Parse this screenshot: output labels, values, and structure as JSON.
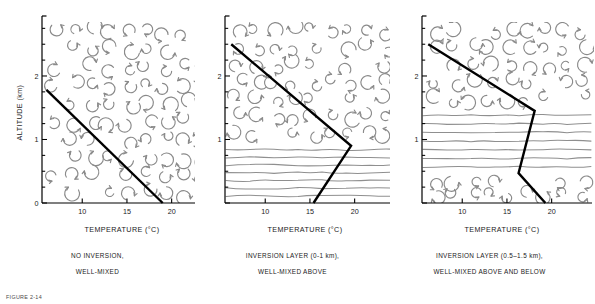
{
  "figure": {
    "caption_label": "FIGURE 2-14"
  },
  "axes": {
    "xlabel": "TEMPERATURE (°C)",
    "ylabel": "ALTITUDE (km)",
    "xticks": [
      10,
      15,
      20
    ],
    "xtick_labels": [
      "10",
      "15",
      "20"
    ],
    "yticks_major": [
      0,
      1,
      2
    ],
    "ytick_labels_panel1": [
      "0",
      "1",
      "2"
    ],
    "ytick_labels_other": [
      "",
      "1",
      "2"
    ],
    "xlim": [
      5.5,
      22.5
    ],
    "ylim": [
      0,
      2.85
    ],
    "minor_y_step": 0.25
  },
  "colors": {
    "profile_line": "#000000",
    "eddy": "#8a8a8a",
    "stable_line": "#8f8f8f",
    "axis": "#000000",
    "text": "#1a1a1a",
    "background": "#ffffff"
  },
  "chart_data": [
    {
      "type": "line",
      "id": "panel-1",
      "title": "NO INVERSION, WELL-MIXED",
      "caption_line1": "NO INVERSION,",
      "caption_line2": "WELL-MIXED",
      "xlabel": "TEMPERATURE (°C)",
      "ylabel": "ALTITUDE (km)",
      "xlim": [
        5.5,
        22.5
      ],
      "ylim": [
        0,
        2.85
      ],
      "grid": false,
      "show_ylabel": true,
      "show_zero_tick_label": true,
      "series": [
        {
          "name": "temperature profile",
          "x": [
            6.0,
            19.0
          ],
          "y": [
            1.78,
            0.0
          ]
        }
      ],
      "annotations": {
        "mixing_regions": [
          {
            "from_km": 0.0,
            "to_km": 2.85,
            "style": "eddies"
          }
        ],
        "stable_regions": []
      }
    },
    {
      "type": "line",
      "id": "panel-2",
      "title": "INVERSION LAYER (0-1 km), WELL-MIXED ABOVE",
      "caption_line1": "INVERSION LAYER (0-1 km),",
      "caption_line2": "WELL-MIXED ABOVE",
      "xlabel": "TEMPERATURE (°C)",
      "ylabel": "",
      "xlim": [
        5.5,
        22.5
      ],
      "ylim": [
        0,
        2.85
      ],
      "grid": false,
      "show_ylabel": false,
      "show_zero_tick_label": false,
      "series": [
        {
          "name": "temperature profile",
          "x": [
            6.2,
            19.6,
            15.4
          ],
          "y": [
            2.5,
            0.9,
            0.0
          ]
        }
      ],
      "annotations": {
        "mixing_regions": [
          {
            "from_km": 0.95,
            "to_km": 2.85,
            "style": "eddies"
          }
        ],
        "stable_regions": [
          {
            "from_km": 0.05,
            "to_km": 0.9,
            "style": "wavy-lines",
            "line_count": 7
          }
        ]
      }
    },
    {
      "type": "line",
      "id": "panel-3",
      "title": "INVERSION LAYER (0.5-1.5 km), WELL-MIXED ABOVE AND BELOW",
      "caption_line1": "INVERSION LAYER (0.5–1.5 km),",
      "caption_line2": "WELL-MIXED ABOVE AND BELOW",
      "xlabel": "TEMPERATURE (°C)",
      "ylabel": "",
      "xlim": [
        5.5,
        22.5
      ],
      "ylim": [
        0,
        2.85
      ],
      "grid": false,
      "show_ylabel": false,
      "show_zero_tick_label": false,
      "series": [
        {
          "name": "temperature profile",
          "x": [
            6.2,
            18.1,
            16.3,
            19.3
          ],
          "y": [
            2.5,
            1.45,
            0.47,
            0.0
          ]
        }
      ],
      "annotations": {
        "mixing_regions": [
          {
            "from_km": 1.5,
            "to_km": 2.85,
            "style": "eddies"
          },
          {
            "from_km": 0.0,
            "to_km": 0.45,
            "style": "eddies"
          }
        ],
        "stable_regions": [
          {
            "from_km": 0.5,
            "to_km": 1.45,
            "style": "wavy-lines",
            "line_count": 7
          }
        ]
      }
    }
  ]
}
